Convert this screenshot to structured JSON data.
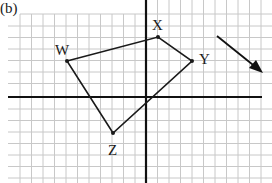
{
  "figure": {
    "label": "(b)",
    "points": [
      {
        "name": "W",
        "x": 67,
        "y": 61,
        "label_x": 56,
        "label_y": 54
      },
      {
        "name": "X",
        "x": 158,
        "y": 37,
        "label_x": 153,
        "label_y": 30
      },
      {
        "name": "Y",
        "x": 192,
        "y": 61,
        "label_x": 199,
        "label_y": 64
      },
      {
        "name": "Z",
        "x": 113,
        "y": 133,
        "label_x": 109,
        "label_y": 155
      }
    ],
    "arrow": {
      "x1": 217,
      "y1": 36,
      "x2": 262,
      "y2": 72
    },
    "axes": {
      "x_axis_y": 97,
      "y_axis_x": 146
    },
    "colors": {
      "grid": "#c8c8c8",
      "axis": "#111111",
      "shape": "#1a1a1a"
    }
  },
  "labels": {
    "figure": "(b)",
    "W": "W",
    "X": "X",
    "Y": "Y",
    "Z": "Z"
  }
}
